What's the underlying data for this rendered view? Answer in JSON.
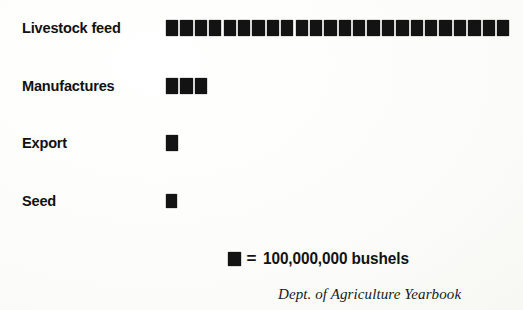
{
  "chart_data": {
    "type": "bar",
    "subtype": "pictogram-isotype",
    "title": "",
    "xlabel": "",
    "ylabel": "",
    "unit_label": "= 100,000,000 bushels",
    "unit_value": 100000000,
    "unit_text": "100,000,000 bushels",
    "symbol": "filled-square",
    "categories": [
      "Livestock feed",
      "Manufactures",
      "Export",
      "Seed"
    ],
    "values": [
      2400000000,
      300000000,
      100000000,
      100000000
    ],
    "symbol_counts": [
      24,
      3,
      1,
      1
    ],
    "grid": false,
    "legend": "bottom-center",
    "source": "Dept. of Agriculture Yearbook"
  },
  "rows": [
    {
      "label": "Livestock feed",
      "count": 24,
      "small": false
    },
    {
      "label": "Manufactures",
      "count": 3,
      "small": false
    },
    {
      "label": "Export",
      "count": 1,
      "small": false
    },
    {
      "label": "Seed",
      "count": 1,
      "small": true
    }
  ],
  "legend": {
    "equals": "=",
    "text": "100,000,000 bushels"
  },
  "credit": {
    "source": "Dept. of Agriculture Yearbook"
  },
  "colors": {
    "symbol": "#131313",
    "text": "#111111",
    "background": "#fdfdfb"
  }
}
